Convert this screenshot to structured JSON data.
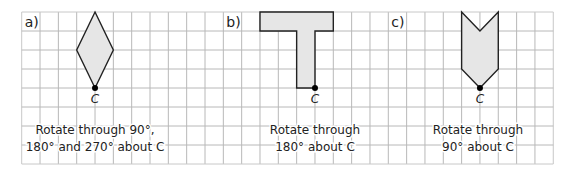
{
  "grid": {
    "origin_x": 21.7,
    "origin_y": 12,
    "cols": 29,
    "rows": 8,
    "cell_w": 18.33,
    "cell_h": 19,
    "line_color": "#b8b8b8",
    "border_color": "#c8c8c8"
  },
  "colors": {
    "shape_fill": "#e6e6e6",
    "shape_stroke": "#222222",
    "point": "#000000",
    "text": "#222222"
  },
  "problems": [
    {
      "label": "a)",
      "label_cell": [
        0,
        0
      ],
      "shape": "rhombus",
      "vertices": [
        [
          4,
          0
        ],
        [
          5,
          2
        ],
        [
          4,
          4
        ],
        [
          3,
          2
        ]
      ],
      "center_point": {
        "name": "C",
        "cell": [
          4,
          4
        ]
      },
      "instruction_lines": [
        "Rotate through 90°,",
        "180° and 270° about C"
      ],
      "instruction_center_x": 95,
      "instruction_y": [
        134,
        151
      ]
    },
    {
      "label": "b)",
      "label_cell": [
        11,
        0
      ],
      "shape": "T-shape",
      "vertices": [
        [
          13,
          0
        ],
        [
          17,
          0
        ],
        [
          17,
          1
        ],
        [
          16,
          1
        ],
        [
          16,
          4
        ],
        [
          15,
          4
        ],
        [
          15,
          1
        ],
        [
          13,
          1
        ]
      ],
      "center_point": {
        "name": "C",
        "cell": [
          16,
          4
        ]
      },
      "instruction_lines": [
        "Rotate through",
        "180° about C"
      ],
      "instruction_center_x": 315,
      "instruction_y": [
        134,
        151
      ]
    },
    {
      "label": "c)",
      "label_cell": [
        20,
        0
      ],
      "shape": "arrow",
      "vertices": [
        [
          24,
          0
        ],
        [
          25,
          1
        ],
        [
          26,
          0
        ],
        [
          26,
          3
        ],
        [
          25,
          4
        ],
        [
          24,
          3
        ]
      ],
      "center_point": {
        "name": "C",
        "cell": [
          25,
          4
        ]
      },
      "instruction_lines": [
        "Rotate through",
        "90° about C"
      ],
      "instruction_center_x": 478,
      "instruction_y": [
        134,
        151
      ]
    }
  ]
}
